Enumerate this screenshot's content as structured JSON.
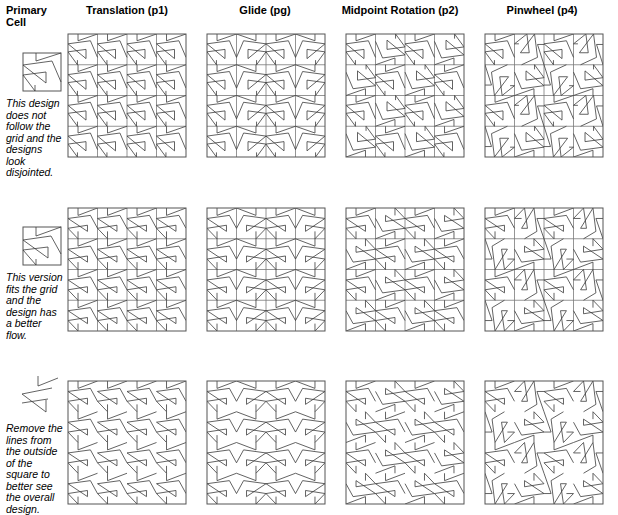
{
  "figure": {
    "columns": [
      {
        "key": "primary",
        "label": "Primary\nCell"
      },
      {
        "key": "p1",
        "label": "Translation (p1)"
      },
      {
        "key": "pg",
        "label": "Glide (pg)"
      },
      {
        "key": "p2",
        "label": "Midpoint Rotation (p2)"
      },
      {
        "key": "p4",
        "label": "Pinwheel (p4)"
      }
    ],
    "column_labels": {
      "primary_line1": "Primary",
      "primary_line2": "Cell",
      "translation": "Translation (p1)",
      "glide": "Glide (pg)",
      "midpoint_rotation": "Midpoint Rotation (p2)",
      "pinwheel": "Pinwheel (p4)"
    },
    "rows": [
      {
        "key": "row1",
        "note": "This design does not follow the grid and the designs look disjointed.",
        "cell_style": "square-with-border",
        "grid_visible": true
      },
      {
        "key": "row2",
        "note": "This version fits the grid and the design has a better flow.",
        "cell_style": "square-with-border",
        "grid_visible": true
      },
      {
        "key": "row3",
        "note": "Remove the lines from the outside of the square to better see the overall design.",
        "cell_style": "lines-only",
        "grid_visible": false
      }
    ],
    "colors": {
      "line": "#3b3b3b",
      "grid": "#7a7a7a",
      "frame": "#555555",
      "text": "#000000",
      "background": "#ffffff"
    },
    "geometry": {
      "tile_count_x": 4,
      "tile_count_y": 4,
      "pattern_square_px": 120,
      "primary_cell_px": 38
    },
    "caption": ""
  }
}
